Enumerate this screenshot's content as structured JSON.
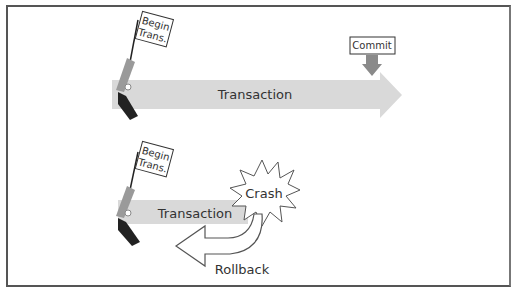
{
  "diagram": {
    "top_scenario": {
      "flag_text": [
        "Begin",
        "Trans."
      ],
      "arrow_label": "Transaction",
      "commit_label": "Commit"
    },
    "bottom_scenario": {
      "flag_text": [
        "Begin",
        "Trans."
      ],
      "arrow_label": "Transaction",
      "crash_label": "Crash",
      "rollback_label": "Rollback"
    },
    "colors": {
      "arrow_fill": "#d9d9d9",
      "commit_marker": "#8a8a8a",
      "pistol_barrel": "#9a9a9a",
      "pistol_grip": "#222222",
      "frame": "#555555"
    }
  }
}
